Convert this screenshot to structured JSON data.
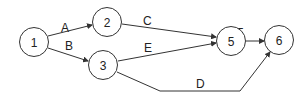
{
  "diagram": {
    "type": "activity-on-arrow network",
    "nodes": [
      {
        "id": "1",
        "label": "1",
        "cx": 34,
        "cy": 42
      },
      {
        "id": "2",
        "label": "2",
        "cx": 107,
        "cy": 22
      },
      {
        "id": "3",
        "label": "3",
        "cx": 103,
        "cy": 65
      },
      {
        "id": "5",
        "label": "5",
        "cx": 231,
        "cy": 41
      },
      {
        "id": "6",
        "label": "6",
        "cx": 279,
        "cy": 40
      }
    ],
    "edges": [
      {
        "label": "A",
        "from": "1",
        "to": "2"
      },
      {
        "label": "B",
        "from": "1",
        "to": "3"
      },
      {
        "label": "C",
        "from": "2",
        "to": "5"
      },
      {
        "label": "E",
        "from": "3",
        "to": "5"
      },
      {
        "label": "D",
        "from": "3",
        "to": "6"
      },
      {
        "label": "F",
        "from": "5",
        "to": "6"
      }
    ],
    "colors": {
      "stroke": "#333333",
      "text": "#222222",
      "background": "#ffffff"
    }
  }
}
